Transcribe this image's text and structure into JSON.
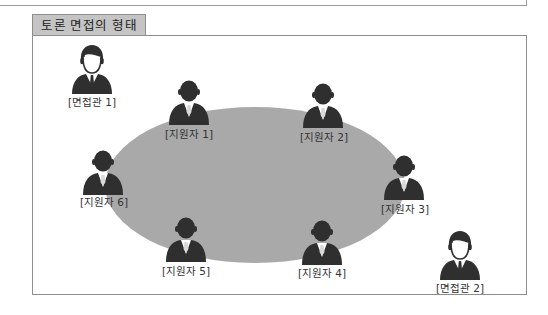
{
  "title": "토론 면접의 형태",
  "colors": {
    "table": "#a9a9a9",
    "silhouette": "#2f2f2f",
    "title_tab_bg": "#c4c4c4",
    "border": "#8e8e8e"
  },
  "interviewers": [
    {
      "label": "[면접관 1]",
      "icon": "interviewer-icon"
    },
    {
      "label": "[면접관 2]",
      "icon": "interviewer-icon"
    }
  ],
  "applicants": [
    {
      "label": "[지원자 1]",
      "icon": "applicant-icon"
    },
    {
      "label": "[지원자 2]",
      "icon": "applicant-icon"
    },
    {
      "label": "[지원자 3]",
      "icon": "applicant-icon"
    },
    {
      "label": "[지원자 4]",
      "icon": "applicant-icon"
    },
    {
      "label": "[지원자 5]",
      "icon": "applicant-icon"
    },
    {
      "label": "[지원자 6]",
      "icon": "applicant-icon"
    }
  ],
  "table_label": "discussion-table"
}
